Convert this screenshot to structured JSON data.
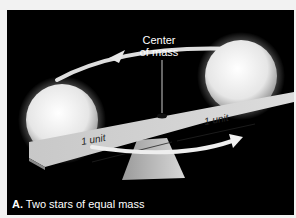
{
  "figure": {
    "caption_label": "A.",
    "caption_text": "Two stars of equal mass",
    "center_label_line1": "Center",
    "center_label_line2": "of mass",
    "left_distance": "1 unit",
    "right_distance": "1 unit"
  },
  "colors": {
    "background": "#000000",
    "star": "#f5f5f5",
    "beam": "#cfcfcf",
    "arrow": "#e8e8e8",
    "caption_text": "#ffffff"
  }
}
